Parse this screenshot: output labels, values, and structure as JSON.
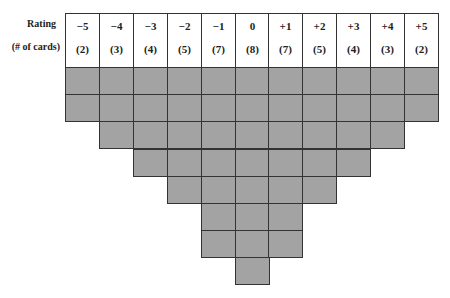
{
  "labels": {
    "rating": "Rating",
    "num_cards": "(# of cards)"
  },
  "columns": [
    {
      "rating": "−5",
      "cards": "(2)",
      "count": 2
    },
    {
      "rating": "−4",
      "cards": "(3)",
      "count": 3
    },
    {
      "rating": "−3",
      "cards": "(4)",
      "count": 4
    },
    {
      "rating": "−2",
      "cards": "(5)",
      "count": 5
    },
    {
      "rating": "−1",
      "cards": "(7)",
      "count": 7
    },
    {
      "rating": "0",
      "cards": "(8)",
      "count": 8
    },
    {
      "rating": "+1",
      "cards": "(7)",
      "count": 7
    },
    {
      "rating": "+2",
      "cards": "(5)",
      "count": 5
    },
    {
      "rating": "+3",
      "cards": "(4)",
      "count": 4
    },
    {
      "rating": "+4",
      "cards": "(3)",
      "count": 3
    },
    {
      "rating": "+5",
      "cards": "(2)",
      "count": 2
    }
  ],
  "colors": {
    "cell_fill": "#a3a3a3",
    "border": "#333333"
  }
}
